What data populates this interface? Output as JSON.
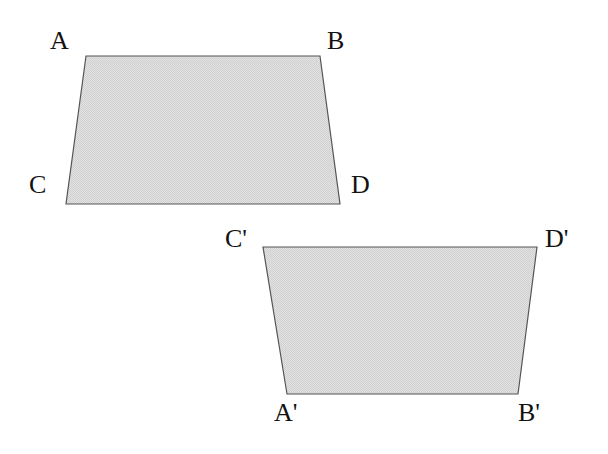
{
  "figure": {
    "background_color": "#ffffff",
    "fill_color": "#d9d9d9",
    "stroke_color": "#555555",
    "label_color": "#121212",
    "stroke_width": 1.2,
    "shapes": [
      {
        "id": "quadrilateral-abdc",
        "name": "upper-quadrilateral",
        "points": "86,56 320,56 340,204 66,204",
        "vertices": [
          {
            "label": "A",
            "x": 86,
            "y": 56
          },
          {
            "label": "B",
            "x": 320,
            "y": 56
          },
          {
            "label": "D",
            "x": 340,
            "y": 204
          },
          {
            "label": "C",
            "x": 66,
            "y": 204
          }
        ]
      },
      {
        "id": "quadrilateral-cdba-prime",
        "name": "lower-quadrilateral",
        "points": "263,247 537,247 518,394 287,394",
        "vertices": [
          {
            "label": "C'",
            "x": 263,
            "y": 247
          },
          {
            "label": "D'",
            "x": 537,
            "y": 247
          },
          {
            "label": "B'",
            "x": 518,
            "y": 394
          },
          {
            "label": "A'",
            "x": 287,
            "y": 394
          }
        ]
      }
    ],
    "labels": {
      "a": "A",
      "b": "B",
      "c": "C",
      "d": "D",
      "a_prime": "A'",
      "b_prime": "B'",
      "c_prime": "C'",
      "d_prime": "D'"
    }
  }
}
